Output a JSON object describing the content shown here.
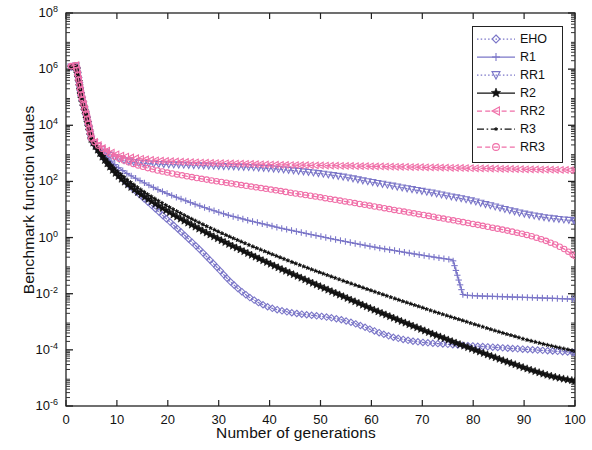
{
  "chart_data": {
    "type": "line",
    "title": "",
    "xlabel": "Number of generations",
    "ylabel": "Benchmark function values",
    "xlim": [
      0,
      100
    ],
    "ylim": [
      1e-06,
      100000000.0
    ],
    "yscale": "log",
    "grid": false,
    "legend_position": "top-right",
    "xticks": [
      0,
      10,
      20,
      30,
      40,
      50,
      60,
      70,
      80,
      90,
      100
    ],
    "xtick_labels": [
      "0",
      "10",
      "20",
      "30",
      "40",
      "50",
      "60",
      "70",
      "80",
      "90",
      "100"
    ],
    "yticks": [
      1e-06,
      0.0001,
      0.01,
      1,
      100,
      10000,
      1000000,
      100000000
    ],
    "ytick_labels": [
      "10-6",
      "10-4",
      "10-2",
      "100",
      "102",
      "104",
      "106",
      "108"
    ],
    "ytick_mantissa": [
      "10",
      "10",
      "10",
      "10",
      "10",
      "10",
      "10",
      "10"
    ],
    "ytick_exponents": [
      "-6",
      "-4",
      "-2",
      "0",
      "2",
      "4",
      "6",
      "8"
    ],
    "x": [
      1,
      2,
      3,
      4,
      5,
      6,
      7,
      8,
      9,
      10,
      12,
      14,
      16,
      18,
      20,
      22,
      24,
      26,
      28,
      30,
      32,
      34,
      36,
      38,
      40,
      42,
      44,
      46,
      48,
      50,
      52,
      54,
      56,
      58,
      60,
      62,
      64,
      66,
      68,
      70,
      72,
      74,
      76,
      78,
      80,
      82,
      84,
      86,
      88,
      90,
      92,
      94,
      96,
      98,
      100
    ],
    "series": [
      {
        "name": "EHO",
        "color": "#7b76c8",
        "marker": "diamond",
        "linestyle": "dotted",
        "values": [
          1200000.0,
          1300000.0,
          100000.0,
          20000.0,
          3000.0,
          1600.0,
          900.0,
          520.0,
          320.0,
          200.0,
          85,
          40,
          19,
          9.0,
          4.2,
          2.0,
          0.92,
          0.42,
          0.18,
          0.075,
          0.03,
          0.014,
          0.0075,
          0.0046,
          0.0032,
          0.00255,
          0.00215,
          0.0019,
          0.00172,
          0.00158,
          0.0014,
          0.0012,
          0.00096,
          0.00072,
          0.00052,
          0.00038,
          0.00029,
          0.00024,
          0.000205,
          0.000185,
          0.000172,
          0.000162,
          0.000153,
          0.000145,
          0.000138,
          0.000131,
          0.000124,
          0.000117,
          0.000111,
          0.000105,
          0.0001,
          9.5e-05,
          9e-05,
          8.5e-05,
          8e-05
        ]
      },
      {
        "name": "R1",
        "color": "#7b76c8",
        "marker": "plus",
        "linestyle": "solid",
        "values": [
          1250000.0,
          1350000.0,
          110000.0,
          22000.0,
          3200.0,
          1900.0,
          1200.0,
          750.0,
          500.0,
          340.0,
          190,
          120,
          78,
          52,
          36,
          26,
          19,
          14,
          10.5,
          8.0,
          6.2,
          5.0,
          4.0,
          3.3,
          2.7,
          2.2,
          1.85,
          1.55,
          1.3,
          1.1,
          0.92,
          0.78,
          0.66,
          0.56,
          0.48,
          0.41,
          0.36,
          0.31,
          0.27,
          0.235,
          0.205,
          0.18,
          0.16,
          0.009,
          0.0085,
          0.0082,
          0.008,
          0.0078,
          0.0076,
          0.0074,
          0.0072,
          0.007,
          0.0068,
          0.0066,
          0.0064
        ]
      },
      {
        "name": "RR1",
        "color": "#7b76c8",
        "marker": "triangle-down",
        "linestyle": "dotted",
        "values": [
          1220000.0,
          1320000.0,
          105000.0,
          21000.0,
          3100.0,
          2000.0,
          1400.0,
          1000.0,
          800.0,
          660.0,
          520.0,
          460.0,
          430.0,
          410.0,
          400.0,
          390.0,
          380.0,
          370.0,
          360.0,
          350.0,
          340.0,
          330.0,
          320.0,
          305.0,
          290.0,
          270.0,
          250.0,
          230.0,
          210.0,
          190.0,
          170.0,
          150.0,
          130.0,
          110.0,
          95,
          82,
          70,
          60,
          52,
          45,
          39,
          33,
          28,
          24,
          20,
          16,
          13,
          10.5,
          8.5,
          7.0,
          6.0,
          5.2,
          4.7,
          4.3,
          4.0
        ]
      },
      {
        "name": "R2",
        "color": "#111111",
        "marker": "star",
        "linestyle": "solid",
        "values": [
          1180000.0,
          1280000.0,
          95000.0,
          19000.0,
          2900.0,
          1500.0,
          800.0,
          450.0,
          270.0,
          170.0,
          80,
          42,
          24,
          14,
          8.5,
          5.2,
          3.3,
          2.1,
          1.35,
          0.88,
          0.58,
          0.39,
          0.26,
          0.175,
          0.118,
          0.08,
          0.055,
          0.038,
          0.026,
          0.018,
          0.0125,
          0.0087,
          0.006,
          0.0042,
          0.0029,
          0.00205,
          0.00145,
          0.00102,
          0.00073,
          0.00052,
          0.00037,
          0.00027,
          0.000195,
          0.000142,
          0.000104,
          7.6e-05,
          5.6e-05,
          4.1e-05,
          3.1e-05,
          2.3e-05,
          1.75e-05,
          1.35e-05,
          1.08e-05,
          9e-06,
          7.8e-06
        ]
      },
      {
        "name": "RR2",
        "color": "#f06fa8",
        "marker": "triangle-left",
        "linestyle": "dashed",
        "values": [
          1300000.0,
          1400000.0,
          115000.0,
          23000.0,
          3300.0,
          2200.0,
          1600.0,
          1250.0,
          1050.0,
          900.0,
          750.0,
          660.0,
          600.0,
          560.0,
          530.0,
          510.0,
          490.0,
          475.0,
          460.0,
          450.0,
          440.0,
          430.0,
          420.0,
          410.0,
          400.0,
          390.0,
          385.0,
          380.0,
          375.0,
          370.0,
          365.0,
          360.0,
          355.0,
          350.0,
          345.0,
          340.0,
          335.0,
          330.0,
          325.0,
          320.0,
          315.0,
          310.0,
          305.0,
          300.0,
          295.0,
          290.0,
          285.0,
          280.0,
          276.0,
          272.0,
          268.0,
          264.0,
          260.0,
          256.0,
          252.0
        ]
      },
      {
        "name": "R3",
        "color": "#111111",
        "marker": "star-small",
        "linestyle": "dashdot",
        "values": [
          1200000.0,
          1300000.0,
          100000.0,
          20000.0,
          3000.0,
          1700.0,
          950.0,
          580.0,
          370.0,
          240.0,
          115,
          62,
          35,
          21,
          13,
          8.2,
          5.3,
          3.5,
          2.35,
          1.6,
          1.1,
          0.77,
          0.54,
          0.385,
          0.275,
          0.198,
          0.143,
          0.104,
          0.076,
          0.056,
          0.0415,
          0.0308,
          0.023,
          0.0172,
          0.0129,
          0.0097,
          0.0073,
          0.0055,
          0.0042,
          0.0032,
          0.0024,
          0.00185,
          0.00142,
          0.0011,
          0.00084,
          0.00065,
          0.0005,
          0.00039,
          0.00031,
          0.00024,
          0.000195,
          0.000158,
          0.00013,
          0.000108,
          9e-05
        ]
      },
      {
        "name": "RR3",
        "color": "#f06fa8",
        "marker": "circle",
        "linestyle": "dashed",
        "values": [
          1280000.0,
          1380000.0,
          112000.0,
          22500.0,
          3250.0,
          2100.0,
          1500.0,
          1100.0,
          860.0,
          700.0,
          500.0,
          380.0,
          300.0,
          245.0,
          205.0,
          175.0,
          150.0,
          130.0,
          113.0,
          99,
          87,
          76,
          67,
          59,
          52,
          46,
          40,
          35,
          31,
          27,
          23.5,
          20.5,
          17.8,
          15.5,
          13.4,
          11.6,
          10.0,
          8.7,
          7.5,
          6.5,
          5.6,
          4.8,
          4.15,
          3.55,
          3.05,
          2.6,
          2.22,
          1.88,
          1.58,
          1.32,
          1.05,
          0.8,
          0.58,
          0.38,
          0.22
        ]
      }
    ]
  },
  "legend": {
    "items": [
      {
        "label": "EHO"
      },
      {
        "label": "R1"
      },
      {
        "label": "RR1"
      },
      {
        "label": "R2"
      },
      {
        "label": "RR2"
      },
      {
        "label": "R3"
      },
      {
        "label": "RR3"
      }
    ]
  }
}
